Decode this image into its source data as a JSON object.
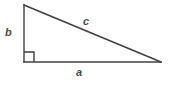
{
  "figure": {
    "kind": "right-triangle-diagram",
    "background_color": "#ffffff",
    "stroke_color": "#3f3f3f",
    "label_color": "#4a4a4a",
    "canvas": {
      "width": 171,
      "height": 85
    },
    "vertices": {
      "top": {
        "x": 24,
        "y": 5
      },
      "bottom_left": {
        "x": 24,
        "y": 62
      },
      "bottom_right": {
        "x": 161,
        "y": 62
      }
    },
    "right_angle_marker": {
      "name": "right-angle-square",
      "x": 24,
      "y": 52,
      "size": 10,
      "at_vertex": "bottom_left"
    },
    "labels": {
      "leg_vertical": "b",
      "hypotenuse": "c",
      "leg_horizontal": "a"
    },
    "sides": [
      {
        "name": "vertical-leg",
        "label": "b",
        "from": "top",
        "to": "bottom_left"
      },
      {
        "name": "hypotenuse",
        "label": "c",
        "from": "top",
        "to": "bottom_right"
      },
      {
        "name": "horizontal-leg",
        "label": "a",
        "from": "bottom_left",
        "to": "bottom_right"
      }
    ]
  }
}
